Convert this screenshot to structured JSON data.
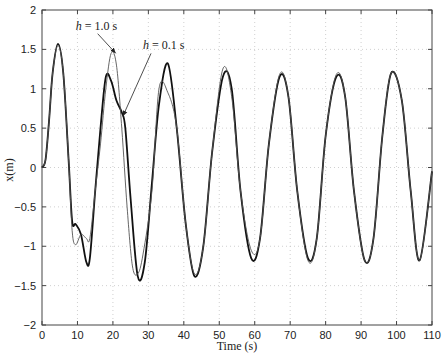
{
  "chart_data": {
    "type": "line",
    "title": "",
    "xlabel": "Time (s)",
    "ylabel": "x(m)",
    "xlim": [
      0,
      110
    ],
    "ylim": [
      -2,
      2
    ],
    "xticks": [
      0,
      10,
      20,
      30,
      40,
      50,
      60,
      70,
      80,
      90,
      100,
      110
    ],
    "yticks": [
      -2,
      -1.5,
      -1,
      -0.5,
      0,
      0.5,
      1,
      1.5,
      2
    ],
    "ytick_labels": [
      "-2",
      "-1.5",
      "-1",
      "-0.5",
      "0",
      "0.5",
      "1",
      "1.5",
      "2"
    ],
    "grid": true,
    "legend": null,
    "annotations": [
      {
        "text_italic": "h",
        "text": " = 1.0 s",
        "x_label": 9.5,
        "y_label": 1.75,
        "arrow_to": [
          20.8,
          1.45
        ]
      },
      {
        "text_italic": "h",
        "text": " = 0.1 s",
        "x_label": 28.5,
        "y_label": 1.5,
        "arrow_to": [
          22.8,
          0.65
        ]
      }
    ],
    "series": [
      {
        "name": "h = 0.1 s",
        "style": "thick",
        "color": "#111111",
        "x": [
          0,
          1,
          2,
          3,
          4.5,
          6,
          7.5,
          8.5,
          9.5,
          11,
          12.5,
          13.5,
          15,
          16.5,
          18,
          19.5,
          21,
          22.5,
          23.5,
          25,
          27,
          29,
          31,
          33,
          35.5,
          38,
          40.5,
          43,
          45.5,
          48,
          51,
          53.5,
          56,
          59,
          61.5,
          64,
          67,
          69.5,
          72,
          75,
          77.5,
          80,
          83,
          85.5,
          88,
          91,
          93.5,
          96,
          98.5,
          101.5,
          104,
          106.5,
          110
        ],
        "y": [
          0,
          0.1,
          0.6,
          1.2,
          1.57,
          1.2,
          0.1,
          -0.68,
          -0.72,
          -0.85,
          -1.2,
          -1.15,
          -0.3,
          0.5,
          1.15,
          1.1,
          0.85,
          0.7,
          0.5,
          -0.4,
          -1.38,
          -1.2,
          -0.2,
          0.8,
          1.32,
          0.5,
          -0.7,
          -1.38,
          -1.0,
          0.2,
          1.15,
          1.0,
          -0.3,
          -1.15,
          -0.9,
          0.3,
          1.15,
          0.9,
          -0.3,
          -1.15,
          -0.9,
          0.4,
          1.15,
          0.9,
          -0.3,
          -1.18,
          -0.9,
          0.4,
          1.2,
          0.85,
          -0.3,
          -1.18,
          -0.05
        ]
      },
      {
        "name": "h = 1.0 s",
        "style": "thin",
        "color": "#555555",
        "x": [
          0,
          1,
          2,
          3,
          4.5,
          6,
          7.5,
          8.5,
          9.5,
          11,
          12.5,
          13.5,
          15,
          16.5,
          18,
          19.5,
          21,
          22.5,
          24,
          25.5,
          27,
          28.5,
          31,
          33,
          35.5,
          38,
          40.5,
          43,
          45.5,
          48,
          51,
          53.5,
          56,
          59,
          61.5,
          64,
          67,
          69.5,
          72,
          75,
          77.5,
          80,
          83,
          85.5,
          88,
          91,
          93.5,
          96,
          98.5,
          101.5,
          104,
          106.5,
          110
        ],
        "y": [
          0,
          0.1,
          0.6,
          1.2,
          1.55,
          1.2,
          0.1,
          -0.8,
          -0.98,
          -0.85,
          -0.9,
          -0.9,
          -0.3,
          0.3,
          1.0,
          1.45,
          1.3,
          0.5,
          -0.5,
          -1.25,
          -1.35,
          -1.1,
          -0.3,
          1.0,
          0.95,
          0.5,
          -0.7,
          -1.35,
          -1.0,
          0.2,
          1.25,
          0.9,
          -0.3,
          -1.05,
          -0.9,
          0.3,
          1.18,
          0.9,
          -0.3,
          -1.18,
          -0.9,
          0.4,
          1.18,
          0.9,
          -0.3,
          -1.18,
          -0.9,
          0.4,
          1.2,
          0.85,
          -0.3,
          -1.18,
          -0.05
        ]
      }
    ]
  }
}
